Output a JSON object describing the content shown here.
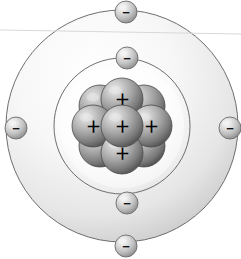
{
  "diagram": {
    "canvas": {
      "width": 241,
      "height": 259
    },
    "background_color": "#ffffff",
    "center": {
      "x": 122,
      "y": 126
    }
  },
  "shells": [
    {
      "name": "outer-electron-shell",
      "id": "shell-outer",
      "radius": 116,
      "stroke_color": "#6e6e6e",
      "stroke_width": 1,
      "fill_light": "#fdfdfd",
      "fill_dark": "#c9c9c9"
    },
    {
      "name": "inner-electron-shell",
      "id": "shell-inner",
      "radius": 68,
      "stroke_color": "#6e6e6e",
      "stroke_width": 1,
      "fill_light": "#ffffff",
      "fill_dark": "#dedede"
    }
  ],
  "electrons": [
    {
      "label": "−",
      "shell": "outer",
      "position": "top",
      "x": 126,
      "y": 12,
      "r": 11
    },
    {
      "label": "−",
      "shell": "outer",
      "position": "left",
      "x": 16,
      "y": 128,
      "r": 11
    },
    {
      "label": "−",
      "shell": "outer",
      "position": "right",
      "x": 230,
      "y": 128,
      "r": 11
    },
    {
      "label": "−",
      "shell": "outer",
      "position": "bottom",
      "x": 126,
      "y": 246,
      "r": 11
    },
    {
      "label": "−",
      "shell": "inner",
      "position": "top",
      "x": 127,
      "y": 58,
      "r": 11
    },
    {
      "label": "−",
      "shell": "inner",
      "position": "bottom",
      "x": 127,
      "y": 203,
      "r": 11
    }
  ],
  "electron_style": {
    "highlight_color": "#f2f2f2",
    "mid_color": "#b4b4b4",
    "edge_color": "#7d7d7d",
    "stroke_color": "#6b6b6b",
    "sign_color": "#111111",
    "sign_font_size": 13
  },
  "nucleus": {
    "name": "atomic-nucleus",
    "center": {
      "x": 122,
      "y": 126
    },
    "nucleon_radius": 21,
    "highlight_color": "#e8e8e8",
    "mid_color": "#9a9a9a",
    "edge_color": "#575757",
    "stroke_color": "#4a4a4a",
    "sign_color": "#000000",
    "sign_font_size": 15,
    "nucleons": [
      {
        "label": "",
        "role": "back",
        "x": 100,
        "y": 106
      },
      {
        "label": "",
        "role": "back",
        "x": 144,
        "y": 106
      },
      {
        "label": "",
        "role": "back",
        "x": 100,
        "y": 146
      },
      {
        "label": "",
        "role": "back",
        "x": 144,
        "y": 146
      },
      {
        "label": "＋",
        "role": "proton",
        "x": 122,
        "y": 99
      },
      {
        "label": "＋",
        "role": "proton",
        "x": 93,
        "y": 126
      },
      {
        "label": "＋",
        "role": "proton",
        "x": 151,
        "y": 126
      },
      {
        "label": "＋",
        "role": "proton",
        "x": 122,
        "y": 153
      },
      {
        "label": "＋",
        "role": "proton",
        "x": 122,
        "y": 126
      }
    ]
  },
  "stray_line": {
    "name": "horizon-artifact-line",
    "x1": 0,
    "y1": 30,
    "x2": 241,
    "y2": 34,
    "color": "#d8d8d8",
    "width": 1
  }
}
